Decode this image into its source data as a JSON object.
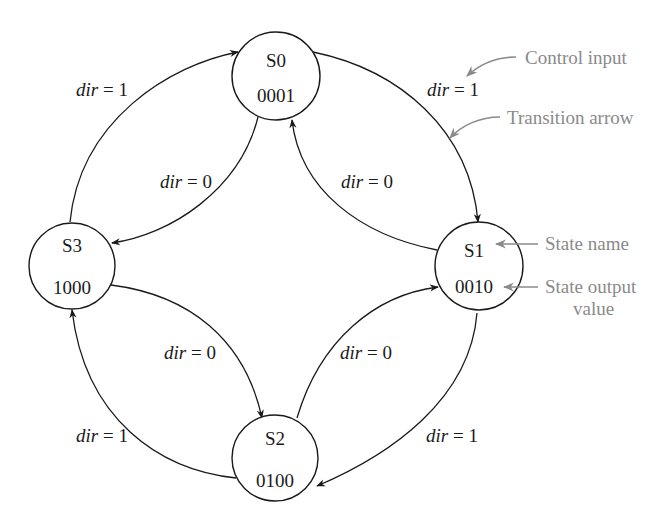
{
  "diagram": {
    "type": "state-transition-diagram",
    "states": [
      {
        "id": "S0",
        "name": "S0",
        "output": "0001"
      },
      {
        "id": "S1",
        "name": "S1",
        "output": "0010"
      },
      {
        "id": "S2",
        "name": "S2",
        "output": "0100"
      },
      {
        "id": "S3",
        "name": "S3",
        "output": "1000"
      }
    ],
    "transitions": [
      {
        "from": "S0",
        "to": "S1",
        "var": "dir",
        "op": " = ",
        "value": "1"
      },
      {
        "from": "S1",
        "to": "S2",
        "var": "dir",
        "op": " = ",
        "value": "1"
      },
      {
        "from": "S2",
        "to": "S3",
        "var": "dir",
        "op": " = ",
        "value": "1"
      },
      {
        "from": "S3",
        "to": "S0",
        "var": "dir",
        "op": " = ",
        "value": "1"
      },
      {
        "from": "S0",
        "to": "S3",
        "var": "dir",
        "op": " = ",
        "value": "0"
      },
      {
        "from": "S1",
        "to": "S0",
        "var": "dir",
        "op": " = ",
        "value": "0"
      },
      {
        "from": "S3",
        "to": "S2",
        "var": "dir",
        "op": " = ",
        "value": "0"
      },
      {
        "from": "S2",
        "to": "S1",
        "var": "dir",
        "op": " = ",
        "value": "0"
      }
    ],
    "annotations": {
      "control_input": "Control input",
      "transition_arrow": "Transition arrow",
      "state_name": "State name",
      "state_output_line1": "State output",
      "state_output_line2": "value"
    },
    "colors": {
      "line": "#1a1a1a",
      "annotation": "#8a8a8a",
      "background": "#ffffff"
    }
  }
}
